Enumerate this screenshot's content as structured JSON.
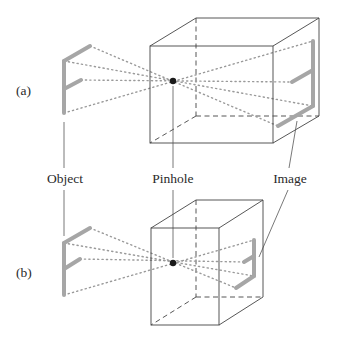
{
  "figure": {
    "panels": [
      {
        "id": "a",
        "label": "(a)",
        "caption_hint": "deeper box — larger image"
      },
      {
        "id": "b",
        "label": "(b)",
        "caption_hint": "shallower box — smaller image"
      }
    ],
    "callouts": {
      "object": "Object",
      "pinhole": "Pinhole",
      "image": "Image"
    },
    "colors": {
      "box_edge": "#444444",
      "ray": "#9a9a9a",
      "letter": "#a6a6a6",
      "pinhole": "#1a1a1a",
      "leader": "#555555",
      "text": "#2a2a2a"
    }
  }
}
